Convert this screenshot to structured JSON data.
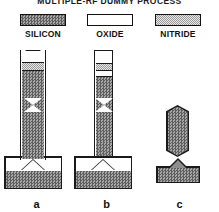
{
  "title": "MULTIPLE-RF DUMMY PROCESS",
  "legend": {
    "items": [
      {
        "label": "SILICON",
        "pattern": "checker-dark",
        "color": "#8d8d8d",
        "swatch_name": "legend-swatch-silicon"
      },
      {
        "label": "OXIDE",
        "pattern": "solid-white",
        "color": "#ffffff",
        "swatch_name": "legend-swatch-oxide"
      },
      {
        "label": "NITRIDE",
        "pattern": "checker-light",
        "color": "#cfcfcf",
        "swatch_name": "legend-swatch-nitride"
      }
    ]
  },
  "figures": [
    {
      "caption": "a",
      "description": "Tall silicon pillar capped with oxide and nitride layers, standing on a silicon substrate with an oxide V-groove undercut",
      "layers": [
        "oxide",
        "nitride",
        "silicon"
      ]
    },
    {
      "caption": "b",
      "description": "Narrower partially etched pillar with oxide cap removed, tapered silicon body on silicon substrate with oxide undercut",
      "layers": [
        "oxide",
        "nitride",
        "silicon"
      ]
    },
    {
      "caption": "c",
      "description": "Released silicon beam detached from the substrate, pointed at both ends above the remaining silicon base",
      "layers": [
        "silicon"
      ]
    }
  ],
  "colors": {
    "outline": "#1a1a1a",
    "silicon_fill": "#8d8d8d",
    "nitride_fill": "#cfcfcf",
    "oxide_fill": "#ffffff",
    "background": "#ffffff"
  }
}
